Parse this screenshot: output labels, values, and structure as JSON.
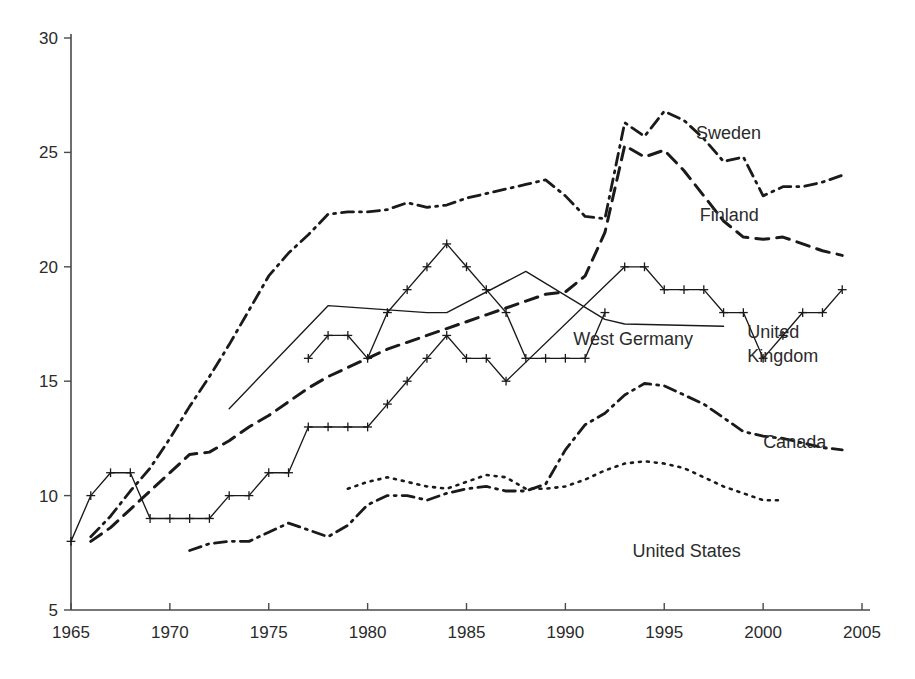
{
  "chart_data": {
    "type": "line",
    "title": "",
    "subtitle": "",
    "xlabel": "",
    "ylabel": "",
    "xlim": [
      1965,
      2005
    ],
    "ylim": [
      5,
      30
    ],
    "grid": false,
    "legend_position": "inline-right-labels",
    "x_ticks": [
      "1965",
      "1970",
      "1975",
      "1980",
      "1985",
      "1990",
      "1995",
      "2000",
      "2005"
    ],
    "y_ticks": [
      "5",
      "10",
      "15",
      "20",
      "25",
      "30"
    ],
    "series": [
      {
        "name": "Sweden",
        "line_style": "dash-dot",
        "marker": "none",
        "label_x": 1996.6,
        "label_y": 25.6,
        "points": [
          [
            1966,
            8.2
          ],
          [
            1967,
            9.1
          ],
          [
            1968,
            10.2
          ],
          [
            1969,
            11.2
          ],
          [
            1970,
            12.5
          ],
          [
            1971,
            13.9
          ],
          [
            1972,
            15.2
          ],
          [
            1973,
            16.6
          ],
          [
            1974,
            18.1
          ],
          [
            1975,
            19.6
          ],
          [
            1976,
            20.6
          ],
          [
            1977,
            21.4
          ],
          [
            1978,
            22.3
          ],
          [
            1979,
            22.4
          ],
          [
            1980,
            22.4
          ],
          [
            1981,
            22.5
          ],
          [
            1982,
            22.8
          ],
          [
            1983,
            22.6
          ],
          [
            1984,
            22.7
          ],
          [
            1985,
            23.0
          ],
          [
            1986,
            23.2
          ],
          [
            1987,
            23.4
          ],
          [
            1988,
            23.6
          ],
          [
            1989,
            23.8
          ],
          [
            1990,
            23.1
          ],
          [
            1991,
            22.2
          ],
          [
            1992,
            22.1
          ],
          [
            1993,
            26.3
          ],
          [
            1994,
            25.7
          ],
          [
            1995,
            26.8
          ],
          [
            1996,
            26.4
          ],
          [
            1997,
            25.6
          ],
          [
            1998,
            24.6
          ],
          [
            1999,
            24.8
          ],
          [
            2000,
            23.1
          ],
          [
            2001,
            23.5
          ],
          [
            2002,
            23.5
          ],
          [
            2003,
            23.7
          ],
          [
            2004,
            24.0
          ]
        ]
      },
      {
        "name": "Finland",
        "line_style": "dashed",
        "marker": "none",
        "label_x": 1996.8,
        "label_y": 22.0,
        "points": [
          [
            1966,
            8.0
          ],
          [
            1967,
            8.6
          ],
          [
            1968,
            9.4
          ],
          [
            1969,
            10.2
          ],
          [
            1970,
            11.0
          ],
          [
            1971,
            11.8
          ],
          [
            1972,
            11.9
          ],
          [
            1973,
            12.4
          ],
          [
            1974,
            13.0
          ],
          [
            1975,
            13.5
          ],
          [
            1976,
            14.1
          ],
          [
            1977,
            14.7
          ],
          [
            1978,
            15.2
          ],
          [
            1979,
            15.6
          ],
          [
            1980,
            16.0
          ],
          [
            1981,
            16.4
          ],
          [
            1982,
            16.7
          ],
          [
            1983,
            17.0
          ],
          [
            1984,
            17.3
          ],
          [
            1985,
            17.6
          ],
          [
            1986,
            17.9
          ],
          [
            1987,
            18.2
          ],
          [
            1988,
            18.5
          ],
          [
            1989,
            18.8
          ],
          [
            1990,
            18.9
          ],
          [
            1991,
            19.6
          ],
          [
            1992,
            21.5
          ],
          [
            1993,
            25.3
          ],
          [
            1994,
            24.8
          ],
          [
            1995,
            25.1
          ],
          [
            1996,
            24.2
          ],
          [
            1997,
            23.1
          ],
          [
            1998,
            22.0
          ],
          [
            1999,
            21.3
          ],
          [
            2000,
            21.2
          ],
          [
            2001,
            21.3
          ],
          [
            2002,
            21.0
          ],
          [
            2003,
            20.7
          ],
          [
            2004,
            20.5
          ]
        ]
      },
      {
        "name": "United Kingdom",
        "line_style": "solid",
        "marker": "plus",
        "label_x": 1999.2,
        "label_y": 16.9,
        "points": [
          [
            1965,
            8.0
          ],
          [
            1966,
            10.0
          ],
          [
            1967,
            11.0
          ],
          [
            1968,
            11.0
          ],
          [
            1969,
            9.0
          ],
          [
            1970,
            9.0
          ],
          [
            1971,
            9.0
          ],
          [
            1972,
            9.0
          ],
          [
            1973,
            10.0
          ],
          [
            1974,
            10.0
          ],
          [
            1975,
            11.0
          ],
          [
            1976,
            11.0
          ],
          [
            1977,
            13.0
          ],
          [
            1978,
            13.0
          ],
          [
            1979,
            13.0
          ],
          [
            1980,
            13.0
          ],
          [
            1981,
            14.0
          ],
          [
            1982,
            15.0
          ],
          [
            1983,
            16.0
          ],
          [
            1984,
            17.0
          ],
          [
            1985,
            16.0
          ],
          [
            1986,
            16.0
          ],
          [
            1987,
            15.0
          ],
          [
            1993,
            20.0
          ],
          [
            1994,
            20.0
          ],
          [
            1995,
            19.0
          ],
          [
            1996,
            19.0
          ],
          [
            1997,
            19.0
          ],
          [
            1998,
            18.0
          ],
          [
            1999,
            18.0
          ],
          [
            2000,
            16.0
          ],
          [
            2001,
            17.0
          ],
          [
            2002,
            18.0
          ],
          [
            2003,
            18.0
          ],
          [
            2004,
            19.0
          ]
        ]
      },
      {
        "name": "United Kingdom secondary",
        "line_style": "solid",
        "marker": "plus",
        "label_x": null,
        "label_y": null,
        "points": [
          [
            1977,
            16.0
          ],
          [
            1978,
            17.0
          ],
          [
            1979,
            17.0
          ],
          [
            1980,
            16.0
          ],
          [
            1981,
            18.0
          ],
          [
            1982,
            19.0
          ],
          [
            1983,
            20.0
          ],
          [
            1984,
            21.0
          ],
          [
            1985,
            20.0
          ],
          [
            1986,
            19.0
          ],
          [
            1987,
            18.0
          ],
          [
            1988,
            16.0
          ],
          [
            1989,
            16.0
          ],
          [
            1990,
            16.0
          ],
          [
            1991,
            16.0
          ],
          [
            1992,
            18.0
          ]
        ]
      },
      {
        "name": "West Germany",
        "line_style": "solid",
        "marker": "none",
        "label_x": 1990.4,
        "label_y": 16.6,
        "points": [
          [
            1973,
            13.8
          ],
          [
            1978,
            18.3
          ],
          [
            1983,
            18.0
          ],
          [
            1984,
            18.0
          ],
          [
            1988,
            19.8
          ],
          [
            1992,
            17.7
          ],
          [
            1993,
            17.5
          ],
          [
            1998,
            17.4
          ]
        ]
      },
      {
        "name": "Canada",
        "line_style": "dash-dot",
        "marker": "none",
        "label_x": 2000.0,
        "label_y": 12.1,
        "points": [
          [
            1971,
            7.6
          ],
          [
            1972,
            7.9
          ],
          [
            1973,
            8.0
          ],
          [
            1974,
            8.0
          ],
          [
            1975,
            8.4
          ],
          [
            1976,
            8.8
          ],
          [
            1977,
            8.5
          ],
          [
            1978,
            8.2
          ],
          [
            1979,
            8.7
          ],
          [
            1980,
            9.6
          ],
          [
            1981,
            10.0
          ],
          [
            1982,
            10.0
          ],
          [
            1983,
            9.8
          ],
          [
            1984,
            10.1
          ],
          [
            1985,
            10.3
          ],
          [
            1986,
            10.4
          ],
          [
            1987,
            10.2
          ],
          [
            1988,
            10.2
          ],
          [
            1989,
            10.5
          ],
          [
            1990,
            12.0
          ],
          [
            1991,
            13.1
          ],
          [
            1992,
            13.6
          ],
          [
            1993,
            14.4
          ],
          [
            1994,
            14.9
          ],
          [
            1995,
            14.8
          ],
          [
            1996,
            14.4
          ],
          [
            1997,
            14.0
          ],
          [
            1998,
            13.4
          ],
          [
            1999,
            12.8
          ],
          [
            2000,
            12.6
          ],
          [
            2001,
            12.5
          ],
          [
            2002,
            12.3
          ],
          [
            2003,
            12.1
          ],
          [
            2004,
            12.0
          ]
        ]
      },
      {
        "name": "United States",
        "line_style": "dotted",
        "marker": "none",
        "label_x": 1993.4,
        "label_y": 7.3,
        "points": [
          [
            1979,
            10.3
          ],
          [
            1980,
            10.6
          ],
          [
            1981,
            10.8
          ],
          [
            1982,
            10.6
          ],
          [
            1983,
            10.4
          ],
          [
            1984,
            10.3
          ],
          [
            1985,
            10.6
          ],
          [
            1986,
            10.9
          ],
          [
            1987,
            10.8
          ],
          [
            1988,
            10.3
          ],
          [
            1989,
            10.3
          ],
          [
            1990,
            10.4
          ],
          [
            1991,
            10.7
          ],
          [
            1992,
            11.1
          ],
          [
            1993,
            11.4
          ],
          [
            1994,
            11.5
          ],
          [
            1995,
            11.4
          ],
          [
            1996,
            11.2
          ],
          [
            1997,
            10.8
          ],
          [
            1998,
            10.4
          ],
          [
            1999,
            10.1
          ],
          [
            2000,
            9.8
          ],
          [
            2001,
            9.8
          ]
        ]
      }
    ]
  }
}
